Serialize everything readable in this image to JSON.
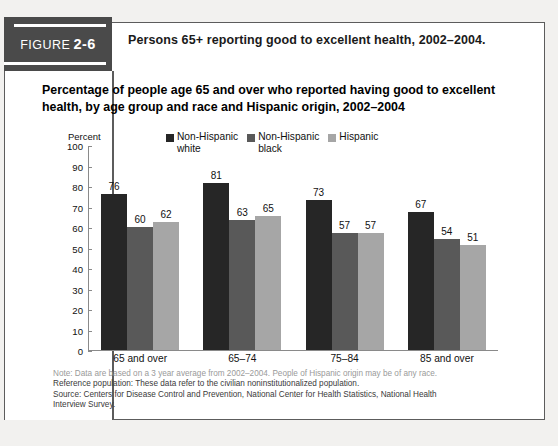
{
  "figure": {
    "badge_prefix": "FIGURE",
    "badge_number": "2-6",
    "caption": "Persons 65+ reporting good to excellent health, 2002–2004."
  },
  "chart_data": {
    "type": "bar",
    "title": "Percentage of people age 65 and over who reported having good to excellent health, by age group and race and Hispanic origin, 2002–2004",
    "xlabel": "",
    "ylabel": "Percent",
    "ylim": [
      0,
      100
    ],
    "ytick_step": 10,
    "yticks": [
      "100",
      "90",
      "80",
      "70",
      "60",
      "50",
      "40",
      "30",
      "20",
      "10",
      "0"
    ],
    "grid": false,
    "legend_position": "top-center",
    "categories": [
      "65 and over",
      "65–74",
      "75–84",
      "85 and over"
    ],
    "series": [
      {
        "name": "Non-Hispanic\nwhite",
        "color": "#262626",
        "values": [
          76,
          81,
          73,
          67
        ]
      },
      {
        "name": "Non-Hispanic\nblack",
        "color": "#595959",
        "values": [
          60,
          63,
          57,
          54
        ]
      },
      {
        "name": "Hispanic",
        "color": "#a6a6a6",
        "values": [
          62,
          65,
          57,
          51
        ]
      }
    ]
  },
  "footnotes": {
    "note": "Note: Data are based on a 3 year average from 2002–2004. People of Hispanic origin may be of any race.",
    "reference": "Reference population: These data refer to the civilian noninstitutionalized population.",
    "source": "Source: Centers for Disease Control and Prevention, National Center for Health Statistics, National Health",
    "source_cont": "Interview Survey."
  }
}
